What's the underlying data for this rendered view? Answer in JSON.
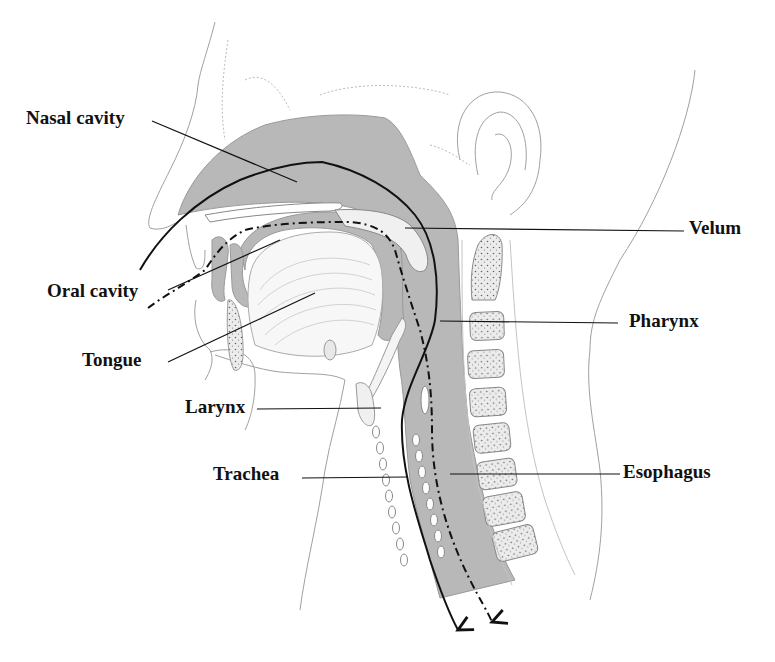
{
  "diagram": {
    "colors": {
      "background": "#ffffff",
      "tissue_fill": "#b8b8b8",
      "outline": "#9a9a9a",
      "airflow_line": "#111111",
      "label_text": "#111111"
    },
    "labels": [
      {
        "id": "nasal-cavity",
        "text": "Nasal cavity",
        "side": "left"
      },
      {
        "id": "oral-cavity",
        "text": "Oral cavity",
        "side": "left"
      },
      {
        "id": "tongue",
        "text": "Tongue",
        "side": "left"
      },
      {
        "id": "larynx",
        "text": "Larynx",
        "side": "left"
      },
      {
        "id": "trachea",
        "text": "Trachea",
        "side": "left"
      },
      {
        "id": "velum",
        "text": "Velum",
        "side": "right"
      },
      {
        "id": "pharynx",
        "text": "Pharynx",
        "side": "right"
      },
      {
        "id": "esophagus",
        "text": "Esophagus",
        "side": "right"
      }
    ],
    "paths": [
      {
        "id": "air-path",
        "style": "solid",
        "description": "Airflow from nose/mouth down through the trachea"
      },
      {
        "id": "food-path",
        "style": "dash-dot",
        "description": "Food path from mouth down through the esophagus"
      }
    ]
  }
}
